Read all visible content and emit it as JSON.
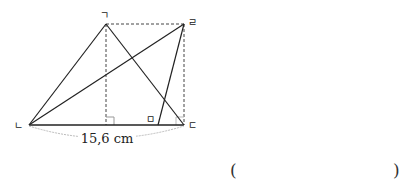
{
  "diagram": {
    "vertices": {
      "g": {
        "label": "ㄱ",
        "x": 106,
        "y": 24
      },
      "r": {
        "label": "ㄹ",
        "x": 184,
        "y": 24
      },
      "n": {
        "label": "ㄴ",
        "x": 29,
        "y": 125
      },
      "d": {
        "label": "ㄷ",
        "x": 184,
        "y": 125
      },
      "m": {
        "label": "ㅁ",
        "x": 158,
        "y": 125
      }
    },
    "measurement": {
      "label": "15,6 cm",
      "segment": "ㄴㄷ"
    },
    "colors": {
      "line": "#222222",
      "dashed": "#444444",
      "arc": "#bbbbbb",
      "right_angle": "#999999"
    }
  },
  "answer": {
    "open": "(",
    "close": ")"
  }
}
